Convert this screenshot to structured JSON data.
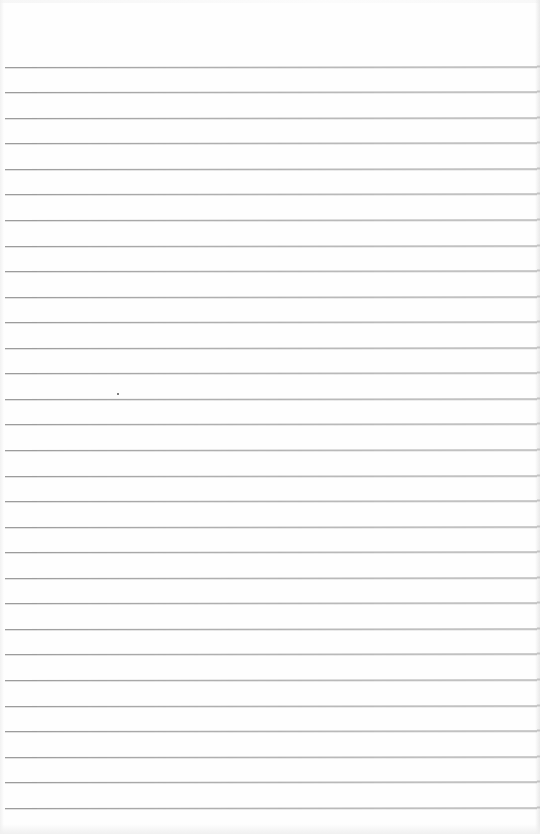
{
  "document": {
    "type": "blank ruled notebook page",
    "background_color": "#fefefe",
    "line_color": "#9c9c9c",
    "line_count": 30,
    "first_line_y": 66.7,
    "line_spacing": 25.55,
    "line_left_x": 5,
    "line_right_x": 537,
    "text_content": "",
    "marks": [
      {
        "name": "ink-speck",
        "x": 117,
        "y": 393
      }
    ]
  }
}
